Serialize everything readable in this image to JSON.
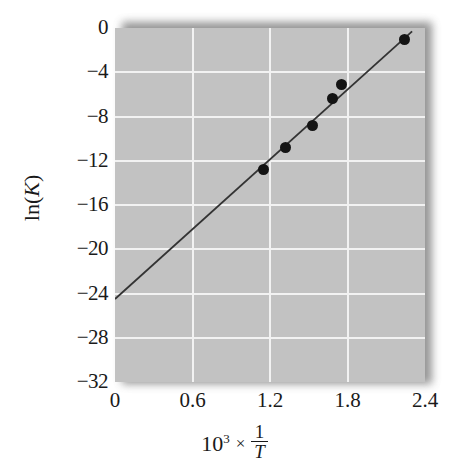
{
  "chart_data": {
    "type": "scatter",
    "title": "",
    "xlabel": "10³ × 1/T",
    "xlabel_parts": {
      "base": "10",
      "exponent": "3",
      "times": "×",
      "fraction_numerator": "1",
      "fraction_denominator": "T"
    },
    "ylabel": "ln(K)",
    "ylabel_parts": {
      "prefix": "ln(",
      "variable": "K",
      "suffix": ")"
    },
    "xlim": [
      0,
      2.4
    ],
    "ylim": [
      -32,
      0
    ],
    "xticks": [
      "0",
      "0.6",
      "1.2",
      "1.8",
      "2.4"
    ],
    "xtick_values": [
      0,
      0.6,
      1.2,
      1.8,
      2.4
    ],
    "yticks": [
      "0",
      "−4",
      "−8",
      "−12",
      "−16",
      "−20",
      "−24",
      "−28",
      "−32"
    ],
    "ytick_values": [
      0,
      -4,
      -8,
      -12,
      -16,
      -20,
      -24,
      -28,
      -32
    ],
    "grid": true,
    "grid_color": "#f2f2f2",
    "plot_background": "#c2c2c2",
    "marker_color": "#141414",
    "line_color": "#333333",
    "legend": null,
    "points": [
      {
        "x": 1.15,
        "y": -12.8
      },
      {
        "x": 1.32,
        "y": -10.8
      },
      {
        "x": 1.53,
        "y": -8.8
      },
      {
        "x": 1.68,
        "y": -6.4
      },
      {
        "x": 1.75,
        "y": -5.1
      },
      {
        "x": 2.24,
        "y": -1.0
      }
    ],
    "series": [
      {
        "name": "data",
        "x": [
          1.15,
          1.32,
          1.53,
          1.68,
          1.75,
          2.24
        ],
        "values": [
          -12.8,
          -10.8,
          -8.8,
          -6.4,
          -5.1,
          -1.0
        ]
      },
      {
        "name": "fit-line",
        "x": [
          0.0,
          2.3
        ],
        "values": [
          -24.5,
          -0.3
        ]
      }
    ],
    "fit_line": {
      "x0": 0.0,
      "y0": -24.5,
      "x1": 2.3,
      "y1": -0.3
    }
  }
}
